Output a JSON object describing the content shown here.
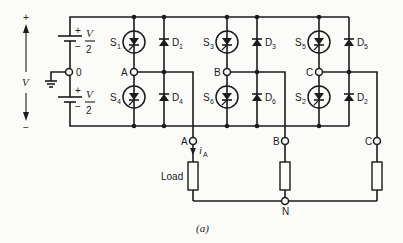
{
  "diagram": {
    "type": "three-phase voltage source inverter circuit",
    "caption": "(a)",
    "supply": {
      "total_label": "V",
      "plus": "+",
      "minus": "−",
      "upper_source": {
        "plus": "+",
        "minus": "−",
        "value_num": "V",
        "value_den": "2"
      },
      "lower_source": {
        "plus": "+",
        "minus": "−",
        "value_num": "V",
        "value_den": "2"
      },
      "midpoint_label": "0"
    },
    "legs": [
      {
        "phase": "A",
        "upper_switch": "S",
        "upper_switch_sub": "1",
        "upper_diode": "D",
        "upper_diode_sub": "1",
        "lower_switch": "S",
        "lower_switch_sub": "4",
        "lower_diode": "D",
        "lower_diode_sub": "4",
        "node_label": "A"
      },
      {
        "phase": "B",
        "upper_switch": "S",
        "upper_switch_sub": "3",
        "upper_diode": "D",
        "upper_diode_sub": "3",
        "lower_switch": "S",
        "lower_switch_sub": "6",
        "lower_diode": "D",
        "lower_diode_sub": "6",
        "node_label": "B"
      },
      {
        "phase": "C",
        "upper_switch": "S",
        "upper_switch_sub": "5",
        "upper_diode": "D",
        "upper_diode_sub": "5",
        "lower_switch": "S",
        "lower_switch_sub": "2",
        "lower_diode": "D",
        "lower_diode_sub": "2",
        "node_label": "C"
      }
    ],
    "load": {
      "label": "Load",
      "terminals": [
        "A",
        "B",
        "C"
      ],
      "current_label": "i",
      "current_sub": "A",
      "neutral_label": "N"
    }
  }
}
